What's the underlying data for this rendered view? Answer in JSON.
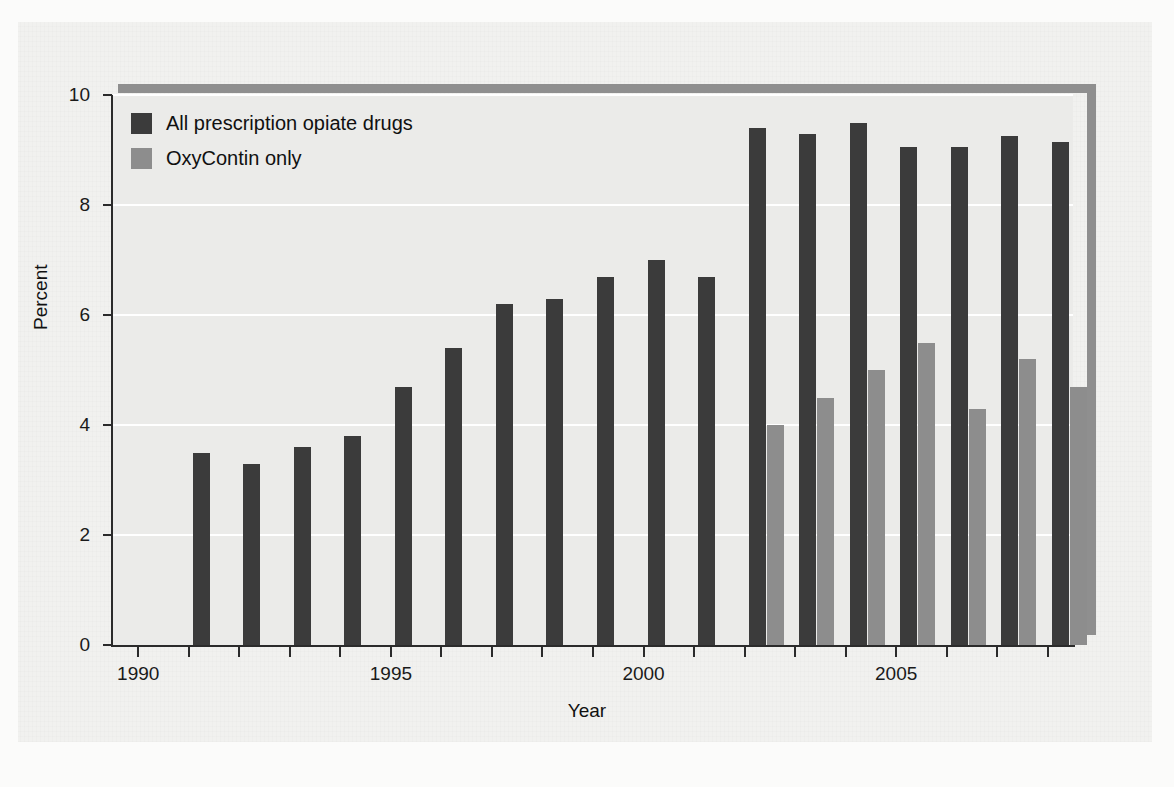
{
  "chart_data": {
    "type": "bar",
    "title": "",
    "xlabel": "Year",
    "ylabel": "Percent",
    "ylim": [
      0,
      10
    ],
    "yticks": [
      0,
      2,
      4,
      6,
      8,
      10
    ],
    "xticks": [
      1990,
      1995,
      2000,
      2005
    ],
    "xlim": [
      1989.5,
      2008.5
    ],
    "grid": "horizontal",
    "legend_position": "top-left",
    "categories": [
      1990,
      1991,
      1992,
      1993,
      1994,
      1995,
      1996,
      1997,
      1998,
      1999,
      2000,
      2001,
      2002,
      2003,
      2004,
      2005,
      2006,
      2007,
      2008
    ],
    "series": [
      {
        "name": "All prescription opiate drugs",
        "color": "#3b3b3b",
        "values": [
          null,
          3.5,
          3.3,
          3.6,
          3.8,
          4.7,
          5.4,
          6.2,
          6.3,
          6.7,
          7.0,
          6.7,
          9.4,
          9.3,
          9.5,
          9.05,
          9.05,
          9.25,
          9.15
        ]
      },
      {
        "name": "OxyContin only",
        "color": "#8d8d8d",
        "values": [
          null,
          null,
          null,
          null,
          null,
          null,
          null,
          null,
          null,
          null,
          null,
          null,
          4.0,
          4.5,
          5.0,
          5.5,
          4.3,
          5.2,
          4.7
        ]
      }
    ]
  },
  "axes": {
    "y_label": "Percent",
    "x_label": "Year",
    "y_tick_labels": [
      "0",
      "2",
      "4",
      "6",
      "8",
      "10"
    ],
    "x_tick_labels": [
      "1990",
      "1995",
      "2000",
      "2005"
    ]
  },
  "legend": {
    "items": [
      {
        "label": "All prescription opiate drugs",
        "swatch": "dark"
      },
      {
        "label": "OxyContin only",
        "swatch": "light"
      }
    ]
  },
  "colors": {
    "background": "#f1f1ef",
    "plot_background": "#ebebe9",
    "gridline": "#ffffff",
    "axis": "#2b2b2b",
    "shadow": "#8f8f8f",
    "series_dark": "#3b3b3b",
    "series_light": "#8d8d8d"
  }
}
